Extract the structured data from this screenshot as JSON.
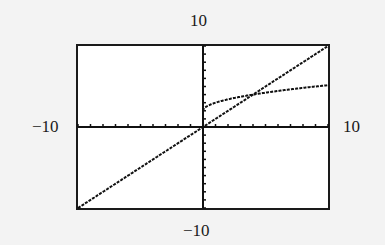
{
  "window": {
    "ymax_label": "10",
    "ymin_label": "−10",
    "xmin_label": "−10",
    "xmax_label": "10"
  },
  "chart_data": {
    "type": "line",
    "title": "",
    "xlabel": "",
    "ylabel": "",
    "xlim": [
      -10,
      10
    ],
    "ylim": [
      -10,
      10
    ],
    "xscl": 1,
    "yscl": 1,
    "grid": false,
    "legend": null,
    "tick_labels": {
      "xmin": "−10",
      "xmax": "10",
      "ymin": "−10",
      "ymax": "10"
    },
    "series": [
      {
        "name": "y = x",
        "x": [
          -10,
          -5,
          0,
          5,
          10
        ],
        "y": [
          -10,
          -5,
          0,
          5,
          10
        ]
      },
      {
        "name": "y = 2 + √x",
        "x": [
          0,
          1,
          2,
          4,
          6,
          8,
          10
        ],
        "y": [
          2,
          3,
          3.41,
          4,
          4.45,
          4.83,
          5.16
        ]
      }
    ],
    "annotations": [
      {
        "type": "intersection",
        "x": 4,
        "y": 4
      }
    ]
  }
}
